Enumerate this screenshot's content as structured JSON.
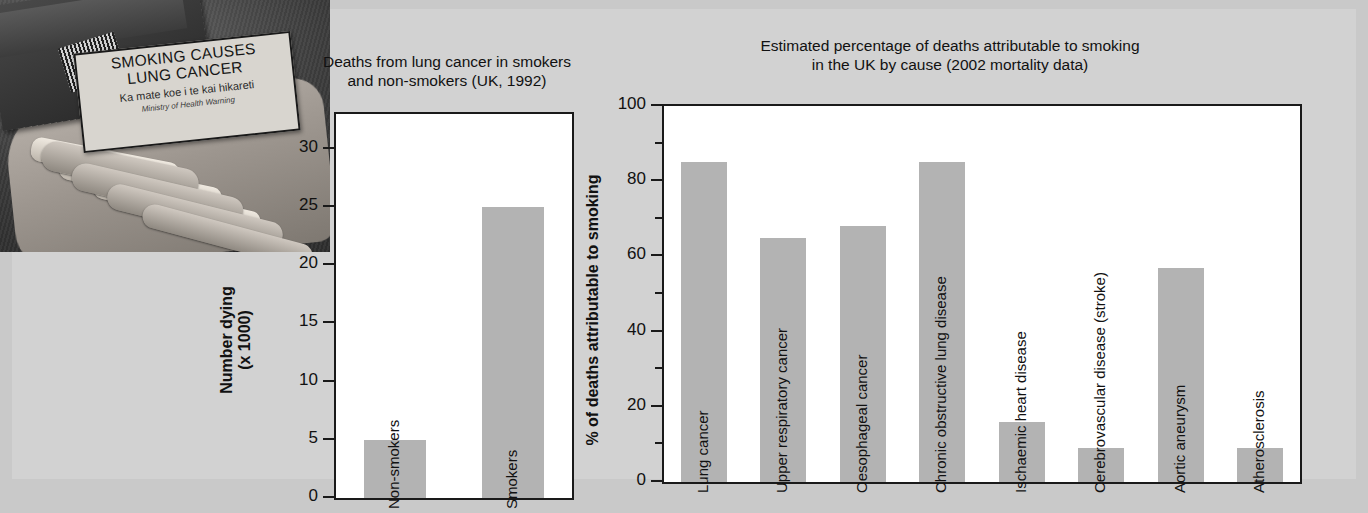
{
  "photo": {
    "alt_name": "cigarette-pack-in-hand-photo",
    "warning_label": {
      "line1": "SMOKING CAUSES",
      "line2": "LUNG CANCER",
      "line3": "Ka mate koe i te kai hikareti",
      "line4": "Ministry of Health Warning"
    }
  },
  "chart_data": [
    {
      "id": "chart1",
      "type": "bar",
      "title": "Deaths from lung cancer in smokers and non-smokers (UK, 1992)",
      "title_lines": [
        "Deaths from lung cancer in smokers",
        "and non-smokers (UK, 1992)"
      ],
      "xlabel": "",
      "ylabel": "Number dying (x 1000)",
      "ylabel_lines": [
        "Number dying",
        "(x 1000)"
      ],
      "categories": [
        "Non-smokers",
        "Smokers"
      ],
      "values": [
        5,
        25
      ],
      "ylim": [
        0,
        33
      ],
      "yticks": [
        0,
        5,
        10,
        15,
        20,
        25,
        30
      ],
      "grid": false,
      "legend": "none",
      "bar_color": "#b3b3b3"
    },
    {
      "id": "chart2",
      "type": "bar",
      "title": "Estimated percentage of deaths attributable to smoking in the UK by cause (2002 mortality data)",
      "title_lines": [
        "Estimated percentage of deaths attributable to smoking",
        "in the UK by cause (2002 mortality data)"
      ],
      "xlabel": "",
      "ylabel": "% of deaths attributable to smoking",
      "categories": [
        "Lung cancer",
        "Upper respiratory cancer",
        "Oesophageal cancer",
        "Chronic obstructive lung disease",
        "Ischaemic heart disease",
        "Cerebrovascular disease (stroke)",
        "Aortic aneurysm",
        "Atherosclerosis"
      ],
      "values": [
        85,
        65,
        68,
        85,
        16,
        9,
        57,
        9
      ],
      "ylim": [
        0,
        100
      ],
      "yticks": [
        0,
        20,
        40,
        60,
        80,
        100
      ],
      "yticks_minor": [
        10,
        30,
        50,
        70,
        90
      ],
      "grid": false,
      "legend": "none",
      "bar_color": "#b3b3b3"
    }
  ],
  "colors": {
    "page_background": "#c9c9c9",
    "panel_background": "#d2d2d2",
    "plot_background": "#ffffff",
    "axis": "#1a1a1a",
    "bar_fill": "#b3b3b3",
    "text": "#111111"
  }
}
